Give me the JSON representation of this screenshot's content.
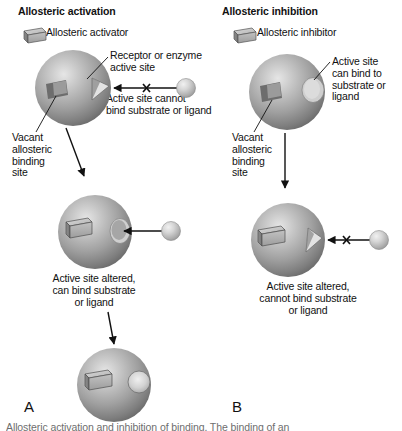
{
  "figure": {
    "panels": [
      {
        "id": "A",
        "letter": "A",
        "title": "Allosteric activation",
        "legend_label": "Allosteric activator",
        "labels": [
          {
            "name": "active-site-callout",
            "text": "Receptor or enzyme\nactive site"
          },
          {
            "name": "binding-blocked-callout",
            "text": "Active site cannot\nbind substrate or ligand"
          },
          {
            "name": "vacant-site-callout",
            "text": "Vacant\nallosteric\nbinding\nsite"
          },
          {
            "name": "altered-site-callout",
            "text": "Active site altered,\ncan bind substrate\nor ligand"
          }
        ]
      },
      {
        "id": "B",
        "letter": "B",
        "title": "Allosteric inhibition",
        "legend_label": "Allosteric inhibitor",
        "labels": [
          {
            "name": "active-site-callout",
            "text": "Active site\ncan bind to\nsubstrate or\nligand"
          },
          {
            "name": "vacant-site-callout",
            "text": "Vacant\nallosteric\nbinding\nsite"
          },
          {
            "name": "altered-site-callout",
            "text": "Active site altered,\ncannot bind substrate\nor ligand"
          }
        ]
      }
    ],
    "caption": "Allosteric activation and inhibition of binding. The binding of an"
  },
  "colors": {
    "sphere_light": "#d8d8d8",
    "sphere_mid": "#9a9a9a",
    "sphere_dark": "#6f6f6f",
    "ligand_light": "#e4e4e4",
    "ligand_mid": "#b4b4b4",
    "box_light": "#cfcfcf",
    "box_mid": "#a8a8a8",
    "box_dark": "#8a8a8a",
    "line": "#111111",
    "text": "#111111",
    "caption_text": "#6e6e6e"
  }
}
